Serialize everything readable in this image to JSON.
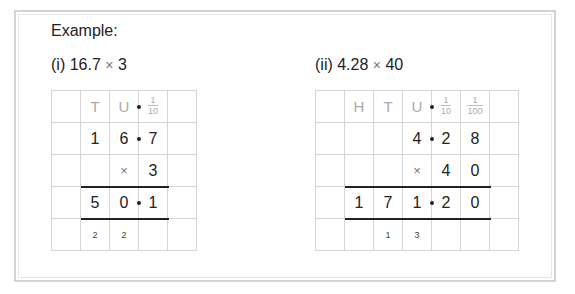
{
  "heading": "Example:",
  "problems": [
    {
      "label_prefix": "(i) 16.7",
      "label_op": "×",
      "label_suffix": "3",
      "headers": [
        "",
        "T",
        "U",
        {
          "num": "1",
          "den": "10"
        },
        ""
      ],
      "rows": [
        [
          "",
          "1",
          "6",
          "7",
          ""
        ],
        [
          "",
          "",
          "×",
          "3",
          ""
        ],
        [
          "",
          "5",
          "0",
          "1",
          ""
        ],
        [
          "",
          "2",
          "2",
          "",
          ""
        ]
      ]
    },
    {
      "label_prefix": "(ii) 4.28",
      "label_op": "×",
      "label_suffix": "40",
      "headers": [
        "",
        "H",
        "T",
        "U",
        {
          "num": "1",
          "den": "10"
        },
        {
          "num": "1",
          "den": "100"
        },
        ""
      ],
      "rows": [
        [
          "",
          "",
          "",
          "4",
          "2",
          "8",
          ""
        ],
        [
          "",
          "",
          "",
          "×",
          "4",
          "0",
          ""
        ],
        [
          "",
          "1",
          "7",
          "1",
          "2",
          "0",
          ""
        ],
        [
          "",
          "",
          "1",
          "3",
          "",
          "",
          ""
        ]
      ]
    }
  ],
  "colors": {
    "frame": "#d4d4d4",
    "grid_line": "#d6d6d6",
    "header_text": "#aaaaaa",
    "rule": "#222222"
  }
}
